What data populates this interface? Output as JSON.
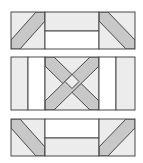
{
  "diagram": {
    "type": "quilt-block-layout",
    "rows": [
      {
        "name": "top-row",
        "description": "diagonal strip squares flanking a two-bar rectangle (light bar on top)"
      },
      {
        "name": "middle-row",
        "description": "vertical strips flanking a crossed X square"
      },
      {
        "name": "bottom-row",
        "description": "diagonal strip squares flanking a two-bar rectangle (light bar on bottom)"
      }
    ]
  },
  "colors": {
    "stroke": "#4a4a4a",
    "fabric_light": "#ececec",
    "fabric_mid": "#c8c8c8",
    "fabric_white": "#ffffff",
    "background": "#ffffff"
  }
}
